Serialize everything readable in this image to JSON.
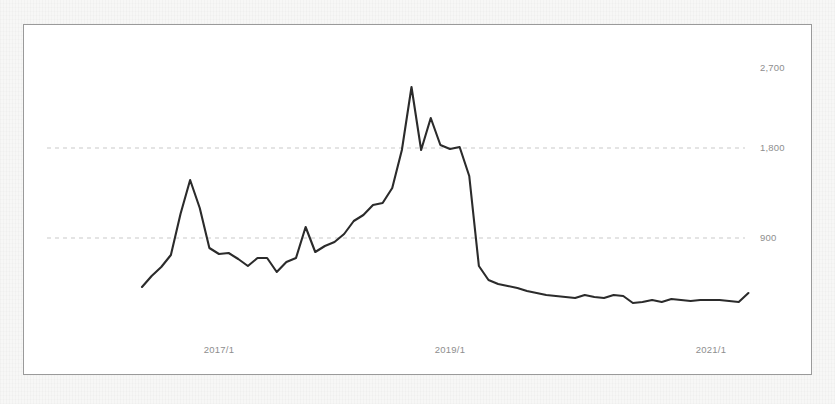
{
  "chart_data": {
    "type": "line",
    "title": "",
    "subtitle": "",
    "xlabel": "",
    "ylabel": "",
    "grid": true,
    "legend": null,
    "legend_position": "none",
    "ylim": [
      0,
      2900
    ],
    "yticks": [
      900,
      1800,
      2700
    ],
    "ytick_labels": [
      "900",
      "1,800",
      "2,700"
    ],
    "gridlines_drawn_at": [
      900,
      1800
    ],
    "xticks": [
      "2017/1",
      "2019/1",
      "2021/1"
    ],
    "xlim": [
      "2016/5",
      "2021/9"
    ],
    "x_axis_type": "date-monthly",
    "series": [
      {
        "name": "value",
        "color": "#2b2b2b",
        "x": [
          "2016/5",
          "2016/6",
          "2016/7",
          "2016/8",
          "2016/9",
          "2016/10",
          "2016/11",
          "2016/12",
          "2017/1",
          "2017/2",
          "2017/3",
          "2017/4",
          "2017/5",
          "2017/6",
          "2017/7",
          "2017/8",
          "2017/9",
          "2017/10",
          "2017/11",
          "2017/12",
          "2018/1",
          "2018/2",
          "2018/3",
          "2018/4",
          "2018/5",
          "2018/6",
          "2018/7",
          "2018/8",
          "2018/9",
          "2018/10",
          "2018/11",
          "2018/12",
          "2019/1",
          "2019/2",
          "2019/3",
          "2019/4",
          "2019/5",
          "2019/6",
          "2019/7",
          "2019/8",
          "2019/9",
          "2019/10",
          "2019/11",
          "2019/12",
          "2020/1",
          "2020/2",
          "2020/3",
          "2020/4",
          "2020/5",
          "2020/6",
          "2020/7",
          "2020/8",
          "2020/9",
          "2020/10",
          "2020/11",
          "2020/12",
          "2021/1",
          "2021/2",
          "2021/3",
          "2021/4",
          "2021/5",
          "2021/6",
          "2021/7",
          "2021/8"
        ],
        "values": [
          410,
          520,
          610,
          730,
          1140,
          1480,
          1200,
          800,
          740,
          750,
          690,
          620,
          700,
          700,
          560,
          660,
          700,
          1010,
          760,
          820,
          860,
          940,
          1070,
          1130,
          1230,
          1250,
          1400,
          1780,
          2410,
          1780,
          2100,
          1830,
          1790,
          1810,
          1520,
          620,
          480,
          440,
          420,
          400,
          370,
          350,
          330,
          320,
          310,
          300,
          330,
          310,
          300,
          330,
          320,
          250,
          260,
          280,
          260,
          290,
          280,
          270,
          280,
          280,
          280,
          270,
          260,
          350
        ]
      }
    ],
    "annotations": []
  },
  "axes": {
    "y_labels": [
      {
        "text": "2,700",
        "value": 2700
      },
      {
        "text": "1,800",
        "value": 1800
      },
      {
        "text": "900",
        "value": 900
      }
    ],
    "x_labels": [
      {
        "text": "2017/1"
      },
      {
        "text": "2019/1"
      },
      {
        "text": "2021/1"
      }
    ]
  },
  "style": {
    "line_color": "#2b2b2b",
    "grid_color": "#c9c9c9",
    "label_color": "#8e8e8e",
    "plot_background": "#ffffff",
    "page_background": "#f7f7f6",
    "frame_border_color": "#9a9a9a"
  }
}
